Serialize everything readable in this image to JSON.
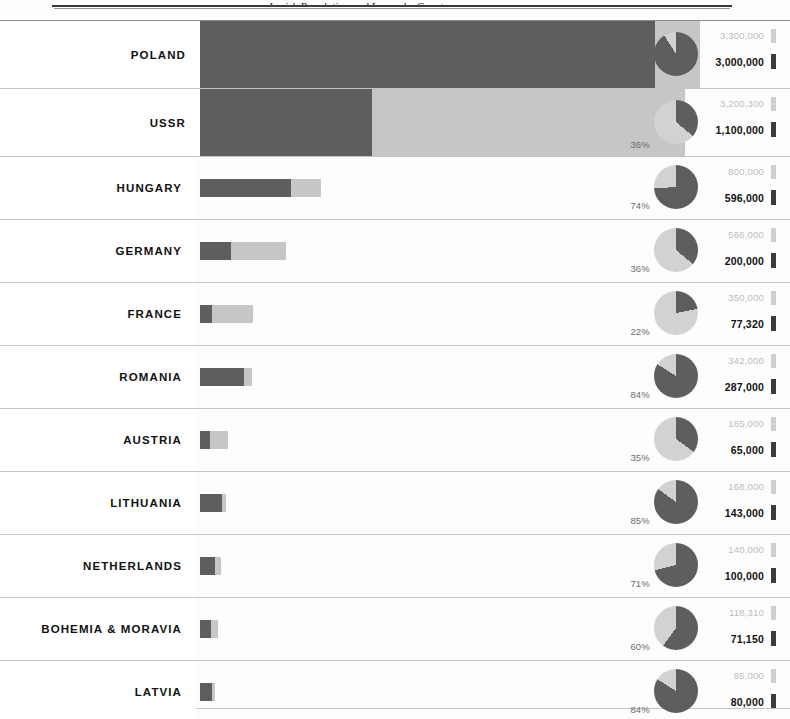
{
  "page": {
    "header_caption": "Jewish Population and Losses by Country",
    "bottom_divider": "divider"
  },
  "colors": {
    "killed": "#5e5e5e",
    "survived": "#c6c6c6",
    "pie_killed": "#5e5e5e",
    "pie_remaining": "#d2d2d2",
    "population_label": "#bcbcbc",
    "killed_label": "#111111"
  },
  "chart_data": {
    "type": "bar",
    "title": "Jewish Population and Losses by Country",
    "xlabel": "",
    "ylabel": "",
    "grid": false,
    "legend_position": "none",
    "categories": [
      "POLAND",
      "USSR",
      "HUNGARY",
      "GERMANY",
      "FRANCE",
      "ROMANIA",
      "AUSTRIA",
      "LITHUANIA",
      "NETHERLANDS",
      "BOHEMIA & MORAVIA",
      "LATVIA"
    ],
    "series": [
      {
        "name": "Killed",
        "values": [
          3000000,
          1100000,
          596000,
          200000,
          77320,
          287000,
          65000,
          143000,
          100000,
          71150,
          80000
        ]
      },
      {
        "name": "Pre-war population",
        "values": [
          3300000,
          3200300,
          800000,
          566000,
          350000,
          342000,
          185000,
          168000,
          140000,
          118310,
          95000
        ]
      }
    ],
    "percent_killed": [
      91,
      36,
      74,
      36,
      22,
      84,
      35,
      85,
      71,
      60,
      84
    ],
    "xlim": [
      0,
      3300000
    ]
  },
  "rows": [
    {
      "country": "POLAND",
      "population_label": "3,300,000",
      "killed_label": "3,000,000",
      "percent_label": "",
      "percent": 91,
      "bar_total_pct": 100.0,
      "bar_killed_pct": 90.9,
      "tall": true
    },
    {
      "country": "USSR",
      "population_label": "3,200,300",
      "killed_label": "1,100,000",
      "percent_label": "36%",
      "percent": 36,
      "bar_total_pct": 97.0,
      "bar_killed_pct": 34.4,
      "tall": true
    },
    {
      "country": "HUNGARY",
      "population_label": "800,000",
      "killed_label": "596,000",
      "percent_label": "74%",
      "percent": 74,
      "bar_total_pct": 24.2,
      "bar_killed_pct": 18.1,
      "tall": false
    },
    {
      "country": "GERMANY",
      "population_label": "566,000",
      "killed_label": "200,000",
      "percent_label": "36%",
      "percent": 36,
      "bar_total_pct": 17.2,
      "bar_killed_pct": 6.1,
      "tall": false
    },
    {
      "country": "FRANCE",
      "population_label": "350,000",
      "killed_label": "77,320",
      "percent_label": "22%",
      "percent": 22,
      "bar_total_pct": 10.6,
      "bar_killed_pct": 2.3,
      "tall": false
    },
    {
      "country": "ROMANIA",
      "population_label": "342,000",
      "killed_label": "287,000",
      "percent_label": "84%",
      "percent": 84,
      "bar_total_pct": 10.4,
      "bar_killed_pct": 8.7,
      "tall": false
    },
    {
      "country": "AUSTRIA",
      "population_label": "185,000",
      "killed_label": "65,000",
      "percent_label": "35%",
      "percent": 35,
      "bar_total_pct": 5.6,
      "bar_killed_pct": 2.0,
      "tall": false
    },
    {
      "country": "LITHUANIA",
      "population_label": "168,000",
      "killed_label": "143,000",
      "percent_label": "85%",
      "percent": 85,
      "bar_total_pct": 5.1,
      "bar_killed_pct": 4.3,
      "tall": false
    },
    {
      "country": "NETHERLANDS",
      "population_label": "140,000",
      "killed_label": "100,000",
      "percent_label": "71%",
      "percent": 71,
      "bar_total_pct": 4.2,
      "bar_killed_pct": 3.0,
      "tall": false
    },
    {
      "country": "BOHEMIA & MORAVIA",
      "population_label": "118,310",
      "killed_label": "71,150",
      "percent_label": "60%",
      "percent": 60,
      "bar_total_pct": 3.6,
      "bar_killed_pct": 2.2,
      "tall": false
    },
    {
      "country": "LATVIA",
      "population_label": "95,000",
      "killed_label": "80,000",
      "percent_label": "84%",
      "percent": 84,
      "bar_total_pct": 2.9,
      "bar_killed_pct": 2.4,
      "tall": false
    }
  ]
}
